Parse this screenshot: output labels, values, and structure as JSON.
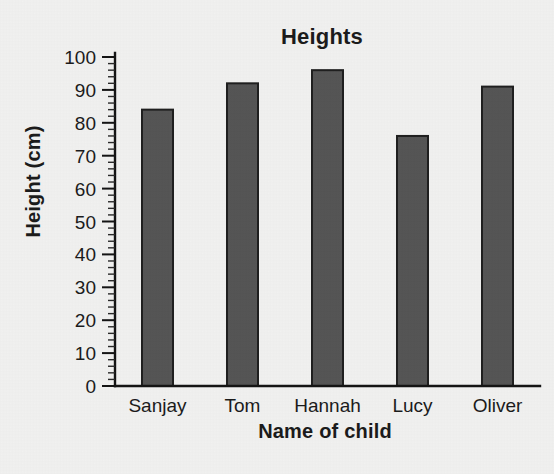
{
  "chart_data": {
    "type": "bar",
    "title": "Heights",
    "xlabel": "Name of child",
    "ylabel": "Height (cm)",
    "categories": [
      "Sanjay",
      "Tom",
      "Hannah",
      "Lucy",
      "Oliver"
    ],
    "values": [
      84,
      92,
      96,
      76,
      91
    ],
    "ylim": [
      0,
      100
    ],
    "y_major_step": 10,
    "y_minor_step": 2,
    "y_tick_labels": [
      "0",
      "10",
      "20",
      "30",
      "40",
      "50",
      "60",
      "70",
      "80",
      "90",
      "100"
    ],
    "grid": false,
    "legend": null,
    "bar_color": "#555555",
    "bar_edge_color": "#1f1f1f",
    "axis_color": "#141414",
    "background_color": "#f1f1f0",
    "text_color": "#1b1b1b"
  }
}
